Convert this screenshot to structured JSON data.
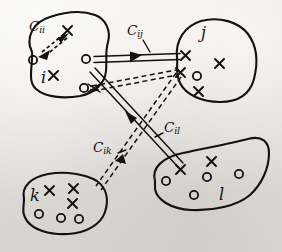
{
  "figure": {
    "kind": "hand-drawn-diagram",
    "background_color": "#ece9e4",
    "ink_color": "#14120f",
    "width": 282,
    "height": 252
  },
  "clusters": [
    {
      "id": "i",
      "label": "i",
      "label_x": 43,
      "label_y": 78,
      "outline": "M 32 52 C 26 38, 34 23, 50 18 C 64 13, 80 11, 94 16 C 105 20, 110 31, 107 42 C 104 52, 106 60, 105 70 C 104 82, 95 92, 80 95 C 64 98, 46 96, 37 88 C 28 80, 33 66, 32 52 Z",
      "markers": [
        {
          "type": "x",
          "x": 68,
          "y": 31
        },
        {
          "type": "o",
          "x": 33,
          "y": 60
        },
        {
          "type": "o",
          "x": 86,
          "y": 59
        },
        {
          "type": "x",
          "x": 53,
          "y": 75
        },
        {
          "type": "o",
          "x": 84,
          "y": 87
        }
      ]
    },
    {
      "id": "j",
      "label": "j",
      "label_x": 203,
      "label_y": 35,
      "outline": "M 176 57 C 174 40, 184 27, 200 22 C 218 17, 238 23, 247 34 C 256 45, 257 62, 253 78 C 249 93, 237 101, 219 101 C 201 101, 185 94, 179 82 C 174 72, 177 66, 176 57 Z",
      "markers": [
        {
          "type": "x",
          "x": 185,
          "y": 55
        },
        {
          "type": "x",
          "x": 219,
          "y": 63
        },
        {
          "type": "x",
          "x": 180,
          "y": 72
        },
        {
          "type": "o",
          "x": 196,
          "y": 76
        },
        {
          "type": "x",
          "x": 198,
          "y": 91
        }
      ]
    },
    {
      "id": "k",
      "label": "k",
      "label_x": 33,
      "label_y": 197,
      "outline": "M 24 198 C 22 186, 32 178, 48 175 C 66 172, 84 175, 96 182 C 106 188, 108 200, 104 211 C 100 223, 86 232, 68 233 C 50 234, 35 229, 28 220 C 22 212, 24 206, 24 198 Z",
      "markers": [
        {
          "type": "x",
          "x": 49,
          "y": 190
        },
        {
          "type": "x",
          "x": 73,
          "y": 188
        },
        {
          "type": "x",
          "x": 72,
          "y": 203
        },
        {
          "type": "o",
          "x": 39,
          "y": 214
        },
        {
          "type": "o",
          "x": 61,
          "y": 218
        },
        {
          "type": "o",
          "x": 79,
          "y": 219
        }
      ]
    },
    {
      "id": "l",
      "label": "l",
      "label_x": 220,
      "label_y": 196,
      "outline": "M 155 180 C 152 168, 163 158, 182 154 C 204 149, 228 145, 247 140 C 261 136, 268 142, 268 153 C 268 167, 262 183, 250 194 C 238 205, 214 210, 192 209 C 172 208, 158 199, 155 188 Z",
      "markers": [
        {
          "type": "x",
          "x": 180,
          "y": 169
        },
        {
          "type": "x",
          "x": 211,
          "y": 161
        },
        {
          "type": "o",
          "x": 166,
          "y": 181
        },
        {
          "type": "o",
          "x": 207,
          "y": 177
        },
        {
          "type": "o",
          "x": 239,
          "y": 174
        },
        {
          "type": "o",
          "x": 194,
          "y": 195
        }
      ]
    }
  ],
  "links": [
    {
      "id": "c_ii",
      "label": "C",
      "subscript": "ii",
      "label_x": 30,
      "label_y": 26,
      "style": "dashed-double",
      "from_cluster": "i",
      "to_cluster": "i",
      "description": "intra-cluster link from o to x inside cluster i"
    },
    {
      "id": "c_ij",
      "label": "C",
      "subscript": "ij",
      "label_x": 128,
      "label_y": 30,
      "style": "solid-double",
      "from_cluster": "i",
      "to_cluster": "j",
      "description": "inter-cluster link from o in i to x in j"
    },
    {
      "id": "c_il",
      "label": "C",
      "subscript": "il",
      "label_x": 164,
      "label_y": 127,
      "style": "solid-double",
      "from_cluster": "i",
      "to_cluster": "l",
      "description": "inter-cluster link from o in i to x in l"
    },
    {
      "id": "c_ik",
      "label": "C",
      "subscript": "ik",
      "label_x": 94,
      "label_y": 147,
      "style": "dashed-double",
      "from_cluster": "i",
      "to_cluster": "k",
      "description": "inter-cluster link from o in i to x in k"
    },
    {
      "id": "c_ij_dashed",
      "label": "",
      "subscript": "",
      "style": "dashed-double",
      "from_cluster": "i",
      "to_cluster": "j",
      "description": "second dashed link from hub in i to x in j"
    }
  ],
  "legend": {
    "marker_x_meaning": "x",
    "marker_o_meaning": "o"
  }
}
